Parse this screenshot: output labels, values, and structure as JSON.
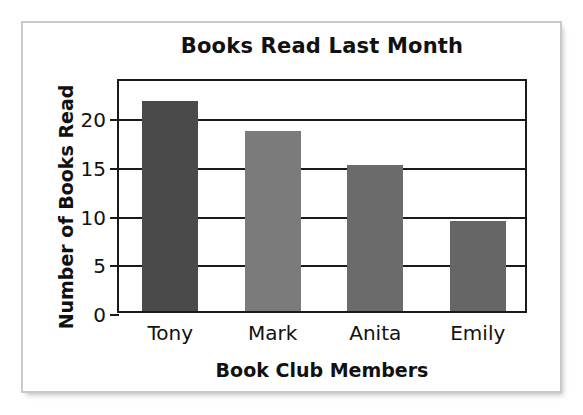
{
  "chart_data": {
    "type": "bar",
    "title": "Books Read Last Month",
    "xlabel": "Book Club Members",
    "ylabel": "Number of Books Read",
    "categories": [
      "Tony",
      "Mark",
      "Anita",
      "Emily"
    ],
    "values": [
      21.5,
      18.5,
      15.0,
      9.2
    ],
    "ylim": [
      0,
      24
    ],
    "yticks": [
      0,
      5,
      10,
      15,
      20
    ],
    "ytick_labels": [
      "0",
      "5",
      "10",
      "15",
      "20"
    ],
    "grid": "horizontal",
    "legend": "none",
    "bar_colors": [
      "#4a4a4a",
      "#7b7b7b",
      "#6b6b6b",
      "#666666"
    ],
    "series": [
      {
        "name": "Books Read",
        "points": [
          {
            "category": "Tony",
            "value": 21.5,
            "color": "#4a4a4a"
          },
          {
            "category": "Mark",
            "value": 18.5,
            "color": "#7b7b7b"
          },
          {
            "category": "Anita",
            "value": 15.0,
            "color": "#6b6b6b"
          },
          {
            "category": "Emily",
            "value": 9.2,
            "color": "#666666"
          }
        ]
      }
    ]
  },
  "style": {
    "axis_color": "#1a1a1a",
    "text_color": "#111111",
    "frame_color": "#c9c9c9",
    "background": "#ffffff"
  }
}
